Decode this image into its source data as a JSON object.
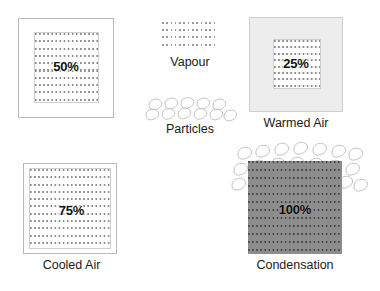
{
  "diagram": {
    "background_color": "#ffffff"
  },
  "legend": {
    "items": [
      {
        "key": "vapour",
        "label": "Vapour",
        "icon": "dotted-texture-swatch",
        "color": "#9a9a9a"
      },
      {
        "key": "particles",
        "label": "Particles",
        "icon": "teardrop-loop-cluster",
        "color": "#c2c2c2"
      }
    ]
  },
  "panels": [
    {
      "id": "neutral-air",
      "percent": "50%",
      "caption": "",
      "outer_fill": "#ffffff",
      "outer_border": "#b9b9b9",
      "inner_fill": "#fdfdfd",
      "has_particles": false
    },
    {
      "id": "warmed-air",
      "percent": "25%",
      "caption": "Warmed Air",
      "outer_fill": "#ededed",
      "outer_border": "#cfcfcf",
      "inner_fill": "#fdfdfd",
      "has_particles": false
    },
    {
      "id": "cooled-air",
      "percent": "75%",
      "caption": "Cooled Air",
      "outer_fill": "#ffffff",
      "outer_border": "#b9b9b9",
      "inner_fill": "#fdfdfd",
      "has_particles": false
    },
    {
      "id": "condensation",
      "percent": "100%",
      "caption": "Condensation",
      "outer_fill": "#8d8d8d",
      "outer_border": "#8d8d8d",
      "inner_fill": "#8d8d8d",
      "has_particles": true
    }
  ]
}
